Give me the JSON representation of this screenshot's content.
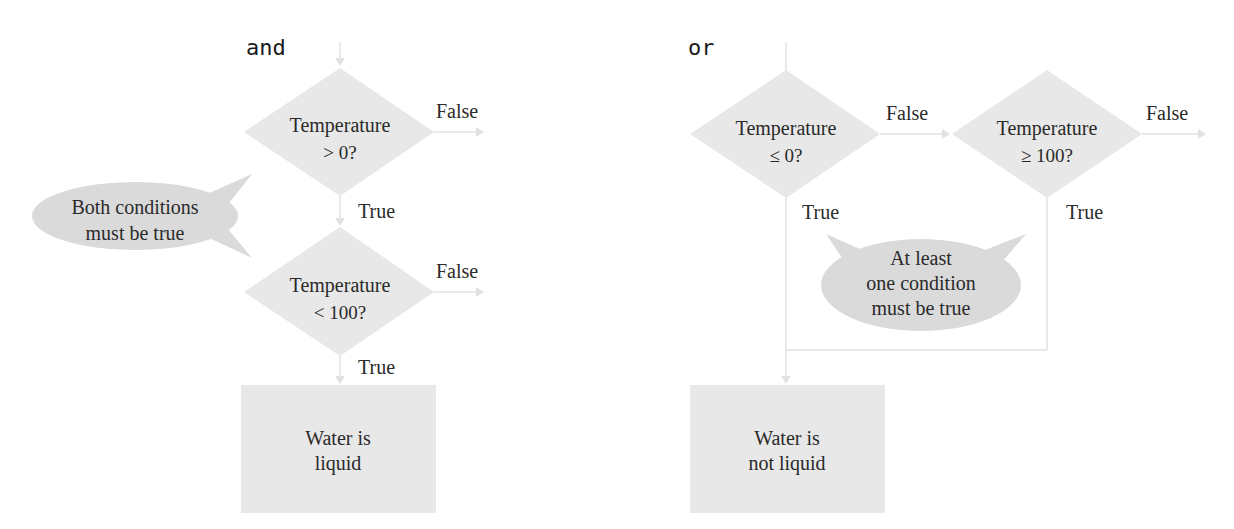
{
  "colors": {
    "shape_fill": "#e8e8e8",
    "bubble_fill": "#dadada",
    "connector": "#e2e2e2",
    "text": "#2a2a2a"
  },
  "and_diagram": {
    "title": "and",
    "decision1": {
      "line1": "Temperature",
      "line2": "> 0?"
    },
    "decision1_false": "False",
    "decision1_true": "True",
    "decision2": {
      "line1": "Temperature",
      "line2": "< 100?"
    },
    "decision2_false": "False",
    "decision2_true": "True",
    "result": {
      "line1": "Water is",
      "line2": "liquid"
    },
    "callout": {
      "line1": "Both conditions",
      "line2": "must be true"
    }
  },
  "or_diagram": {
    "title": "or",
    "decision1": {
      "line1": "Temperature",
      "line2": "≤ 0?"
    },
    "decision1_false": "False",
    "decision1_true": "True",
    "decision2": {
      "line1": "Temperature",
      "line2": "≥ 100?"
    },
    "decision2_false": "False",
    "decision2_true": "True",
    "result": {
      "line1": "Water is",
      "line2": "not liquid"
    },
    "callout": {
      "line1": "At least",
      "line2": "one condition",
      "line3": "must be true"
    }
  }
}
